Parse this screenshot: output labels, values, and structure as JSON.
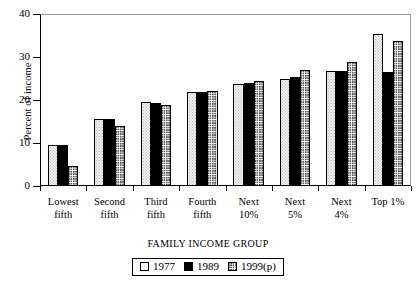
{
  "chart_data": {
    "type": "bar",
    "title": "",
    "xlabel": "FAMILY INCOME GROUP",
    "ylabel": "Percent of income",
    "ylim": [
      0,
      40
    ],
    "yticks": [
      0,
      10,
      20,
      30,
      40
    ],
    "grid": false,
    "legend_position": "bottom-center",
    "categories": [
      "Lowest fifth",
      "Second fifth",
      "Third fifth",
      "Fourth fifth",
      "Next 10%",
      "Next 5%",
      "Next 4%",
      "Top 1%"
    ],
    "category_lines": [
      [
        "Lowest",
        "fifth"
      ],
      [
        "Second",
        "fifth"
      ],
      [
        "Third",
        "fifth"
      ],
      [
        "Fourth",
        "fifth"
      ],
      [
        "Next",
        "10%"
      ],
      [
        "Next",
        "5%"
      ],
      [
        "Next",
        "4%"
      ],
      [
        "Top 1%",
        ""
      ]
    ],
    "series": [
      {
        "name": "1977",
        "values": [
          9.5,
          15.5,
          19.5,
          21.8,
          23.8,
          25.0,
          26.7,
          35.3
        ]
      },
      {
        "name": "1989",
        "values": [
          9.5,
          15.7,
          19.3,
          21.9,
          24.0,
          25.3,
          26.7,
          26.5
        ]
      },
      {
        "name": "1999(p)",
        "values": [
          4.7,
          14.0,
          18.9,
          22.0,
          24.4,
          27.0,
          28.9,
          33.8
        ]
      }
    ]
  },
  "legend": {
    "items": [
      {
        "label": "1977",
        "swatch": "light-stipple-swatch"
      },
      {
        "label": "1989",
        "swatch": "solid-black-swatch"
      },
      {
        "label": "1999(p)",
        "swatch": "hatched-swatch"
      }
    ]
  },
  "colors": {
    "series_1977": "#f0f0f0",
    "series_1989": "#000000",
    "series_1999": "#ffffff",
    "axis": "#000000",
    "frame": "#9a9a9a",
    "background": "#ffffff"
  }
}
